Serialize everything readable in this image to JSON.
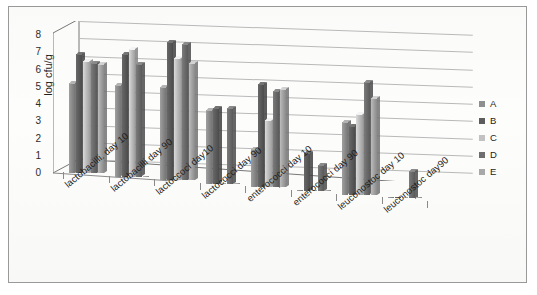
{
  "figure": {
    "type": "scanned-figure",
    "border_color": "#999999",
    "background": "#fdfdfc"
  },
  "chart_data": {
    "type": "bar",
    "title": "",
    "subtitle": "",
    "xlabel": "",
    "ylabel": "log cfu/g",
    "ylim": [
      0,
      8
    ],
    "ytick_labels": [
      "8",
      "7",
      "6",
      "5",
      "4",
      "3",
      "2",
      "1",
      "0"
    ],
    "ytick_values": [
      8,
      7,
      6,
      5,
      4,
      3,
      2,
      1,
      0
    ],
    "grid": true,
    "grid_axis": "y",
    "three_d": true,
    "legend_position": "right",
    "categories": [
      "lactobacilli. day 10",
      "lactobacilli day 90",
      "lactoccoci day10",
      "lactococci day 90",
      "enterococci day 10",
      "enterococci day 90",
      "leuconostoc day 10",
      "leuconostoc day90"
    ],
    "series": [
      {
        "name": "A",
        "color": "#8f8f8f",
        "values": [
          5.2,
          5.3,
          5.4,
          4.3,
          2.2,
          0.0,
          4.2,
          0.05
        ]
      },
      {
        "name": "B",
        "color": "#5d5d5d",
        "values": [
          6.9,
          7.1,
          8.0,
          4.4,
          6.0,
          2.2,
          4.0,
          0.05
        ]
      },
      {
        "name": "C",
        "color": "#c2c2c2",
        "values": [
          6.5,
          7.4,
          7.1,
          0.0,
          3.9,
          0.0,
          4.7,
          0.0
        ]
      },
      {
        "name": "D",
        "color": "#6e6e6e",
        "values": [
          6.4,
          6.5,
          7.9,
          4.4,
          5.6,
          1.5,
          6.5,
          1.6
        ]
      },
      {
        "name": "E",
        "color": "#a8a8a8",
        "values": [
          6.3,
          0.0,
          6.8,
          0.0,
          5.7,
          0.0,
          5.6,
          0.05
        ]
      }
    ],
    "legend": [
      "A",
      "B",
      "C",
      "D",
      "E"
    ]
  }
}
